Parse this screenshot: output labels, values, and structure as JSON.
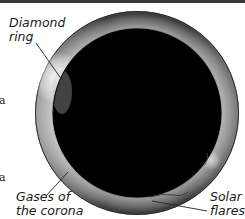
{
  "figure": {
    "labels": {
      "diamond_ring": {
        "line1": "Diamond",
        "line2": "ring"
      },
      "corona_gases": {
        "line1": "Gases of",
        "line2": "the corona"
      },
      "solar_flares": {
        "line1": "Solar",
        "line2": "flares"
      }
    },
    "cropped_text": [
      "a",
      "a"
    ],
    "colors": {
      "moon_disc": "#000000",
      "corona_light": "#e6e6e6",
      "corona_dark": "#4a4a4a",
      "label_text": "#1a1a1a",
      "leader_line": "#222222"
    }
  }
}
